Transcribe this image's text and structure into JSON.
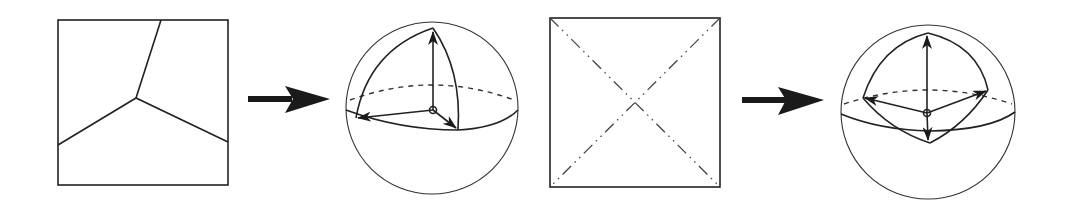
{
  "figure": {
    "panels": [
      {
        "id": "square-three-regions",
        "kind": "square",
        "partition": "three regions meeting at a central vertex"
      },
      {
        "id": "arrow-1",
        "kind": "arrow",
        "direction": "right"
      },
      {
        "id": "sphere-octant",
        "kind": "sphere",
        "feature": "spherical triangle with three orthogonal vector arrows"
      },
      {
        "id": "square-diagonals",
        "kind": "square",
        "partition": "four triangles via dash-dot diagonals"
      },
      {
        "id": "arrow-2",
        "kind": "arrow",
        "direction": "right"
      },
      {
        "id": "sphere-tetrahedral",
        "kind": "sphere",
        "feature": "spherical quadrilateral with four vector arrows"
      }
    ],
    "colors": {
      "line": "#222222",
      "background": "#ffffff"
    }
  }
}
